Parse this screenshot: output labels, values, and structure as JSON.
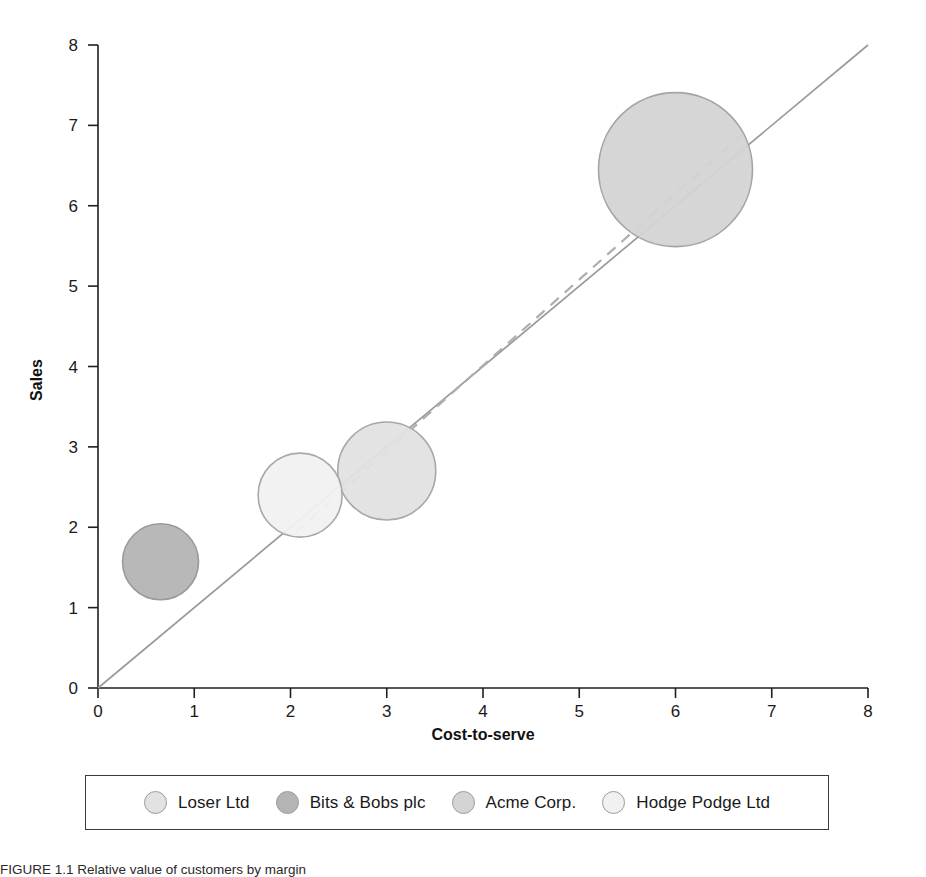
{
  "chart_data": {
    "type": "scatter",
    "title": "",
    "xlabel": "Cost-to-serve",
    "ylabel": "Sales",
    "xlim": [
      0,
      8
    ],
    "ylim": [
      0,
      8
    ],
    "xticks": [
      "0",
      "1",
      "2",
      "3",
      "4",
      "5",
      "6",
      "7",
      "8"
    ],
    "yticks": [
      "0",
      "1",
      "2",
      "3",
      "4",
      "5",
      "6",
      "7",
      "8"
    ],
    "grid": false,
    "legend_position": "bottom",
    "bubble_size_note": "marker radius encodes a third value (relative size)",
    "series": [
      {
        "name": "Loser Ltd",
        "x": 3.0,
        "y": 2.7,
        "radius_px": 49,
        "fill": "#e2e2e2",
        "stroke": "#a8a8a8"
      },
      {
        "name": "Bits & Bobs plc",
        "x": 0.65,
        "y": 1.57,
        "radius_px": 38,
        "fill": "#b4b4b4",
        "stroke": "#9a9a9a"
      },
      {
        "name": "Acme Corp.",
        "x": 6.0,
        "y": 6.45,
        "radius_px": 77,
        "fill": "#d4d4d4",
        "stroke": "#a4a4a4"
      },
      {
        "name": "Hodge Podge Ltd",
        "x": 2.1,
        "y": 2.4,
        "radius_px": 42,
        "fill": "#f1f1f1",
        "stroke": "#a8a8a8"
      }
    ],
    "reference_line": {
      "name": "parity-line",
      "style": "solid",
      "from": [
        0,
        0
      ],
      "to": [
        8,
        8
      ],
      "color": "#9a9a9a"
    },
    "trend_line": {
      "name": "trend-line",
      "style": "dashed",
      "from": [
        2.05,
        1.93
      ],
      "to": [
        6.75,
        6.95
      ],
      "color": "#aeaeae"
    }
  },
  "axes": {
    "x_title": "Cost-to-serve",
    "y_title": "Sales"
  },
  "legend": {
    "items": [
      {
        "label": "Loser Ltd",
        "color": "#e2e2e2"
      },
      {
        "label": "Bits & Bobs plc",
        "color": "#b4b4b4"
      },
      {
        "label": "Acme Corp.",
        "color": "#d4d4d4"
      },
      {
        "label": "Hodge Podge Ltd",
        "color": "#f1f1f1"
      }
    ]
  },
  "caption": {
    "text": "FIGURE 1.1  Relative value of customers by margin"
  },
  "colors": {
    "axis": "#1f1f1f",
    "text": "#1a1a1a",
    "reference_line": "#9a9a9a",
    "trend_line": "#aeaeae",
    "legend_border": "#3a3a3a"
  }
}
